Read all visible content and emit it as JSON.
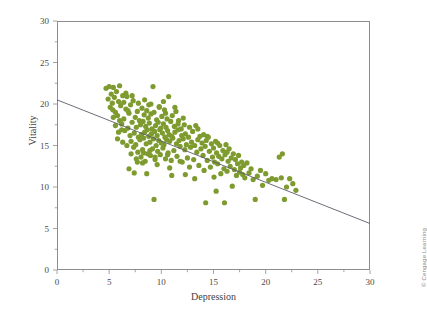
{
  "figure": {
    "credit": "© Cengage Learning",
    "background_color": "#ffffff",
    "frame_color": "#8d8d8d"
  },
  "chart_data": {
    "type": "scatter",
    "title": "",
    "xlabel": "Depression",
    "ylabel": "Vitality",
    "xlim": [
      0,
      30
    ],
    "ylim": [
      0,
      30
    ],
    "xticks": [
      0,
      5,
      10,
      15,
      20,
      25,
      30
    ],
    "xtick_labels": [
      "0",
      "5",
      "10",
      "15",
      "20",
      "25",
      "30"
    ],
    "yticks": [
      0,
      5,
      10,
      15,
      20,
      25,
      30
    ],
    "ytick_labels": [
      "0",
      "5",
      "10",
      "15",
      "20",
      "25",
      "30"
    ],
    "minor_tick_step": 2.5,
    "grid": false,
    "legend": false,
    "marker_color": "#7e9b2f",
    "marker_size": 2.6,
    "series": [
      {
        "name": "Depression vs Vitality",
        "points": [
          [
            4.7,
            21.9
          ],
          [
            4.9,
            20.6
          ],
          [
            5.0,
            22.1
          ],
          [
            5.1,
            19.6
          ],
          [
            5.2,
            21.2
          ],
          [
            5.3,
            20.1
          ],
          [
            5.35,
            19.3
          ],
          [
            5.4,
            22.0
          ],
          [
            5.5,
            20.8
          ],
          [
            5.6,
            19.0
          ],
          [
            5.7,
            21.5
          ],
          [
            5.8,
            18.6
          ],
          [
            5.9,
            20.3
          ],
          [
            6.0,
            22.2
          ],
          [
            6.1,
            19.8
          ],
          [
            6.2,
            17.6
          ],
          [
            6.3,
            21.0
          ],
          [
            6.4,
            18.2
          ],
          [
            6.5,
            16.8
          ],
          [
            6.6,
            19.4
          ],
          [
            6.7,
            20.9
          ],
          [
            6.8,
            17.1
          ],
          [
            6.9,
            18.9
          ],
          [
            7.0,
            16.2
          ],
          [
            7.05,
            19.9
          ],
          [
            7.1,
            15.5
          ],
          [
            7.2,
            17.8
          ],
          [
            7.3,
            20.4
          ],
          [
            7.35,
            14.8
          ],
          [
            7.4,
            16.5
          ],
          [
            7.5,
            18.4
          ],
          [
            7.55,
            15.1
          ],
          [
            7.6,
            17.2
          ],
          [
            7.7,
            19.1
          ],
          [
            7.75,
            14.2
          ],
          [
            7.8,
            16.0
          ],
          [
            7.9,
            18.0
          ],
          [
            7.95,
            15.7
          ],
          [
            8.0,
            17.5
          ],
          [
            8.05,
            13.6
          ],
          [
            8.1,
            16.3
          ],
          [
            8.15,
            19.5
          ],
          [
            8.2,
            14.5
          ],
          [
            8.25,
            17.9
          ],
          [
            8.3,
            15.9
          ],
          [
            8.35,
            18.7
          ],
          [
            8.4,
            16.6
          ],
          [
            8.45,
            13.1
          ],
          [
            8.5,
            17.3
          ],
          [
            8.55,
            15.2
          ],
          [
            8.6,
            19.2
          ],
          [
            8.65,
            16.9
          ],
          [
            8.7,
            14.0
          ],
          [
            8.75,
            18.3
          ],
          [
            8.8,
            16.1
          ],
          [
            8.85,
            17.7
          ],
          [
            8.9,
            15.4
          ],
          [
            8.95,
            13.8
          ],
          [
            9.0,
            18.8
          ],
          [
            9.05,
            16.4
          ],
          [
            9.1,
            17.0
          ],
          [
            9.15,
            14.6
          ],
          [
            9.2,
            22.1
          ],
          [
            9.25,
            15.8
          ],
          [
            9.3,
            19.0
          ],
          [
            9.35,
            16.7
          ],
          [
            9.4,
            13.3
          ],
          [
            9.45,
            17.4
          ],
          [
            9.5,
            15.0
          ],
          [
            9.55,
            18.1
          ],
          [
            9.6,
            16.2
          ],
          [
            9.65,
            14.3
          ],
          [
            9.7,
            17.8
          ],
          [
            9.75,
            15.6
          ],
          [
            9.8,
            19.7
          ],
          [
            9.85,
            16.9
          ],
          [
            9.9,
            13.9
          ],
          [
            9.95,
            17.1
          ],
          [
            10.0,
            15.3
          ],
          [
            10.05,
            18.5
          ],
          [
            10.1,
            16.5
          ],
          [
            10.15,
            14.7
          ],
          [
            10.2,
            17.6
          ],
          [
            10.25,
            15.1
          ],
          [
            10.3,
            19.3
          ],
          [
            10.35,
            16.0
          ],
          [
            10.4,
            13.4
          ],
          [
            10.45,
            17.2
          ],
          [
            10.5,
            15.7
          ],
          [
            10.55,
            18.2
          ],
          [
            10.6,
            16.8
          ],
          [
            10.65,
            14.1
          ],
          [
            10.7,
            20.9
          ],
          [
            10.75,
            16.3
          ],
          [
            10.8,
            15.5
          ],
          [
            10.9,
            17.9
          ],
          [
            10.95,
            13.2
          ],
          [
            11.0,
            16.1
          ],
          [
            11.05,
            18.6
          ],
          [
            11.1,
            15.9
          ],
          [
            11.2,
            14.4
          ],
          [
            11.25,
            17.3
          ],
          [
            11.3,
            16.6
          ],
          [
            11.4,
            19.1
          ],
          [
            11.45,
            15.2
          ],
          [
            11.5,
            13.7
          ],
          [
            11.6,
            16.9
          ],
          [
            11.65,
            18.0
          ],
          [
            11.7,
            15.6
          ],
          [
            11.8,
            14.9
          ],
          [
            11.9,
            17.0
          ],
          [
            11.95,
            16.2
          ],
          [
            12.0,
            13.0
          ],
          [
            12.1,
            15.8
          ],
          [
            12.2,
            17.5
          ],
          [
            12.25,
            14.5
          ],
          [
            12.3,
            16.4
          ],
          [
            12.4,
            15.1
          ],
          [
            12.5,
            13.5
          ],
          [
            12.6,
            16.0
          ],
          [
            12.7,
            17.2
          ],
          [
            12.8,
            14.8
          ],
          [
            12.9,
            15.4
          ],
          [
            13.0,
            16.7
          ],
          [
            13.1,
            13.3
          ],
          [
            13.2,
            15.0
          ],
          [
            13.3,
            17.4
          ],
          [
            13.4,
            14.2
          ],
          [
            13.5,
            15.7
          ],
          [
            13.6,
            12.6
          ],
          [
            13.7,
            16.1
          ],
          [
            13.8,
            14.6
          ],
          [
            13.9,
            15.3
          ],
          [
            14.0,
            13.8
          ],
          [
            14.05,
            16.3
          ],
          [
            14.1,
            12.0
          ],
          [
            14.2,
            14.9
          ],
          [
            14.25,
            8.1
          ],
          [
            14.3,
            15.6
          ],
          [
            14.4,
            13.2
          ],
          [
            14.5,
            16.0
          ],
          [
            14.6,
            14.3
          ],
          [
            14.7,
            12.4
          ],
          [
            14.8,
            15.2
          ],
          [
            14.9,
            13.6
          ],
          [
            15.0,
            14.7
          ],
          [
            15.05,
            11.2
          ],
          [
            15.1,
            13.0
          ],
          [
            15.2,
            15.5
          ],
          [
            15.25,
            9.5
          ],
          [
            15.3,
            14.1
          ],
          [
            15.4,
            12.8
          ],
          [
            15.5,
            13.7
          ],
          [
            15.6,
            15.0
          ],
          [
            15.7,
            11.6
          ],
          [
            15.8,
            13.4
          ],
          [
            15.9,
            14.4
          ],
          [
            16.0,
            12.2
          ],
          [
            16.05,
            8.1
          ],
          [
            16.1,
            13.9
          ],
          [
            16.2,
            15.1
          ],
          [
            16.3,
            11.9
          ],
          [
            16.4,
            13.1
          ],
          [
            16.5,
            14.6
          ],
          [
            16.6,
            12.5
          ],
          [
            16.7,
            13.5
          ],
          [
            16.8,
            10.1
          ],
          [
            16.9,
            14.0
          ],
          [
            17.0,
            12.1
          ],
          [
            17.1,
            13.3
          ],
          [
            17.2,
            11.4
          ],
          [
            17.3,
            12.8
          ],
          [
            17.4,
            13.8
          ],
          [
            17.5,
            11.8
          ],
          [
            17.6,
            12.3
          ],
          [
            17.7,
            13.0
          ],
          [
            17.8,
            11.5
          ],
          [
            17.9,
            12.6
          ],
          [
            18.0,
            11.1
          ],
          [
            18.2,
            12.9
          ],
          [
            18.4,
            11.7
          ],
          [
            18.6,
            12.2
          ],
          [
            18.8,
            10.9
          ],
          [
            19.0,
            8.5
          ],
          [
            19.2,
            11.3
          ],
          [
            19.5,
            12.0
          ],
          [
            19.7,
            10.2
          ],
          [
            20.0,
            11.6
          ],
          [
            20.3,
            10.8
          ],
          [
            20.6,
            11.0
          ],
          [
            21.0,
            10.9
          ],
          [
            21.3,
            13.6
          ],
          [
            21.5,
            11.1
          ],
          [
            21.6,
            14.0
          ],
          [
            21.8,
            8.5
          ],
          [
            22.0,
            10.0
          ],
          [
            22.3,
            11.0
          ],
          [
            22.6,
            10.4
          ],
          [
            22.9,
            9.6
          ],
          [
            9.3,
            8.5
          ],
          [
            6.9,
            12.2
          ],
          [
            7.4,
            11.7
          ],
          [
            8.6,
            11.6
          ],
          [
            11.0,
            11.4
          ],
          [
            12.3,
            11.5
          ],
          [
            13.2,
            11.0
          ],
          [
            6.2,
            16.9
          ],
          [
            5.9,
            16.6
          ],
          [
            6.0,
            18.0
          ],
          [
            7.7,
            13.0
          ],
          [
            8.2,
            12.9
          ],
          [
            9.6,
            12.7
          ],
          [
            10.8,
            12.3
          ],
          [
            12.7,
            12.4
          ],
          [
            5.4,
            18.4
          ],
          [
            5.6,
            17.4
          ],
          [
            6.4,
            20.2
          ],
          [
            6.6,
            21.3
          ],
          [
            7.2,
            21.0
          ],
          [
            8.4,
            20.5
          ],
          [
            9.0,
            20.0
          ],
          [
            9.8,
            19.6
          ],
          [
            10.4,
            18.9
          ],
          [
            11.6,
            17.6
          ],
          [
            8.8,
            19.9
          ],
          [
            7.8,
            20.1
          ],
          [
            6.8,
            19.2
          ],
          [
            10.2,
            20.3
          ],
          [
            11.3,
            19.6
          ],
          [
            12.1,
            18.3
          ],
          [
            13.5,
            17.0
          ],
          [
            14.4,
            16.1
          ],
          [
            15.4,
            15.3
          ],
          [
            16.3,
            14.2
          ],
          [
            8.3,
            14.1
          ],
          [
            8.9,
            14.4
          ],
          [
            9.4,
            13.6
          ],
          [
            10.6,
            13.9
          ],
          [
            11.8,
            13.1
          ],
          [
            7.1,
            14.0
          ],
          [
            7.6,
            13.4
          ],
          [
            6.7,
            15.0
          ],
          [
            6.3,
            15.4
          ],
          [
            5.8,
            15.8
          ]
        ]
      }
    ],
    "regression_line": {
      "label": "",
      "color": "#5c5c6b",
      "x_start": 0,
      "y_start": 20.5,
      "x_end": 30,
      "y_end": 5.6,
      "slope": -0.497,
      "intercept": 20.5
    }
  }
}
